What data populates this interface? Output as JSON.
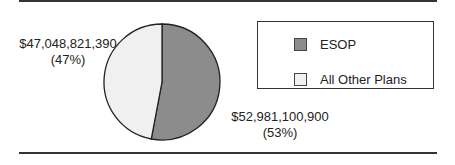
{
  "chart_data": {
    "type": "pie",
    "title": "",
    "slices": [
      {
        "name": "ESOP",
        "value": 52981100900,
        "value_label": "$52,981,100,900",
        "percent": 53,
        "percent_label": "(53%)",
        "color": "#8c8c8c"
      },
      {
        "name": "All Other Plans",
        "value": 47048821390,
        "value_label": "$47,048,821,390",
        "percent": 47,
        "percent_label": "(47%)",
        "color": "#f0f0f0"
      }
    ],
    "legend": {
      "position": "right",
      "entries": [
        "ESOP",
        "All Other Plans"
      ]
    },
    "start_angle_deg": 0,
    "direction": "clockwise"
  },
  "colors": {
    "rule": "#333333",
    "outline": "#222222"
  }
}
